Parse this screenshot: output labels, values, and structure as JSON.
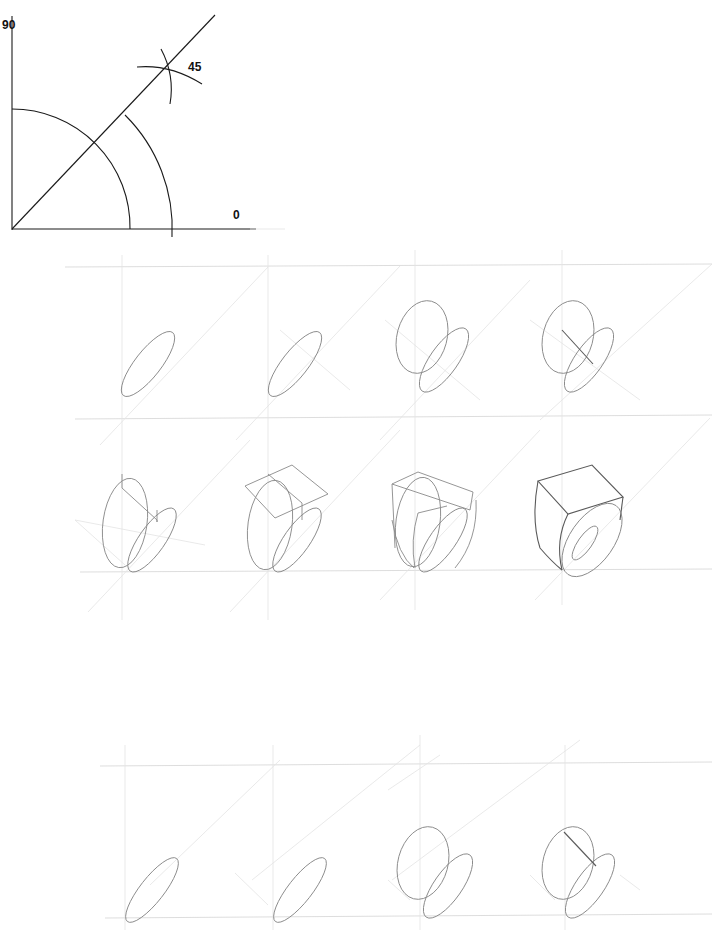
{
  "figure": {
    "type": "ring-construction-tutorial",
    "angle_diagram": {
      "labels": {
        "top": "90",
        "diagonal": "45",
        "right": "0"
      },
      "colors": {
        "ink": "#1a1a1a"
      }
    },
    "upper_grid": {
      "rows": 2,
      "columns": 4,
      "steps": [
        {
          "index": 1,
          "description": "base ellipse on 45° diagonal"
        },
        {
          "index": 2,
          "description": "base ellipse with cross guide"
        },
        {
          "index": 3,
          "description": "vertical ellipse added"
        },
        {
          "index": 4,
          "description": "connecting chord line"
        },
        {
          "index": 5,
          "description": "vertical box guide"
        },
        {
          "index": 6,
          "description": "top plate box construction"
        },
        {
          "index": 7,
          "description": "box and band combined"
        },
        {
          "index": 8,
          "description": "finished signet ring"
        }
      ]
    },
    "lower_grid": {
      "rows": 1,
      "columns": 4,
      "steps": [
        {
          "index": 1,
          "description": "base ellipse"
        },
        {
          "index": 2,
          "description": "base ellipse with guide"
        },
        {
          "index": 3,
          "description": "vertical ellipse added"
        },
        {
          "index": 4,
          "description": "connecting chord line"
        }
      ]
    },
    "colors": {
      "background": "#ffffff",
      "guide_lines": "#d4d4d4",
      "pencil": "#8a8a8a"
    }
  }
}
